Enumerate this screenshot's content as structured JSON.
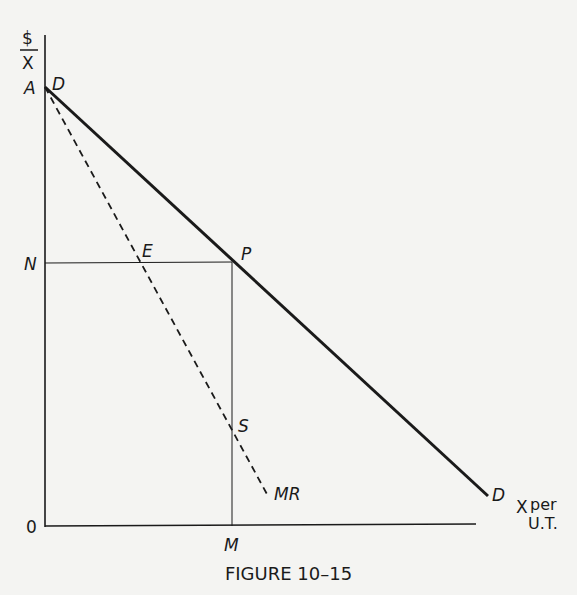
{
  "figure": {
    "caption": "FIGURE 10–15",
    "y_axis_label_top": "$",
    "y_axis_label_bottom": "X",
    "x_axis_label_line1": "X",
    "x_axis_label_per": "per",
    "x_axis_label_line2": "U.T.",
    "origin_label": "0",
    "points": {
      "A": "A",
      "D_top": "D",
      "N": "N",
      "E": "E",
      "P": "P",
      "S": "S",
      "M": "M",
      "MR": "MR",
      "D_bottom": "D"
    },
    "curves": [
      {
        "name": "D",
        "style": "solid-thick",
        "from": [
          45,
          87
        ],
        "to": [
          488,
          496
        ]
      },
      {
        "name": "MR",
        "style": "dashed",
        "from": [
          45,
          87
        ],
        "to": [
          268,
          496
        ]
      },
      {
        "name": "NP",
        "style": "thin",
        "from": [
          45,
          263
        ],
        "to": [
          232,
          263
        ]
      },
      {
        "name": "PM",
        "style": "thin",
        "from": [
          232,
          263
        ],
        "to": [
          232,
          526
        ]
      }
    ],
    "colors": {
      "ink": "#1a1a1a",
      "paper": "#f4f4f2"
    }
  }
}
